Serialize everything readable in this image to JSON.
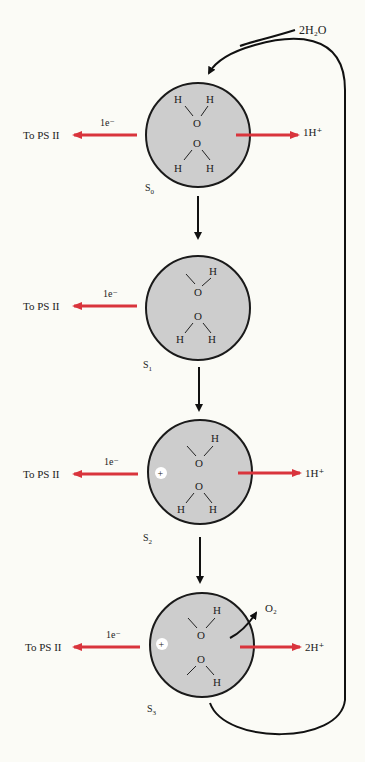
{
  "diagram": {
    "input_label": "2H₂O",
    "colors": {
      "circle_fill": "#cdcdcd",
      "circle_stroke": "#1a1a1a",
      "red_arrow": "#d9343c",
      "black_arrow": "#111111",
      "background": "#fbfbf6"
    },
    "states": [
      {
        "name": "S",
        "sub": "0",
        "electron_label": "1e⁻",
        "electron_dest": "To PS II",
        "proton_label": "1H⁺",
        "has_plus": false,
        "o2": false
      },
      {
        "name": "S",
        "sub": "1",
        "electron_label": "1e⁻",
        "electron_dest": "To PS II",
        "proton_label": "",
        "has_plus": false,
        "o2": false
      },
      {
        "name": "S",
        "sub": "2",
        "electron_label": "1e⁻",
        "electron_dest": "To PS II",
        "proton_label": "1H⁺",
        "has_plus": true,
        "o2": false
      },
      {
        "name": "S",
        "sub": "3",
        "electron_label": "1e⁻",
        "electron_dest": "To PS II",
        "proton_label": "2H⁺",
        "has_plus": true,
        "o2": true
      }
    ],
    "o2_label": "O₂",
    "atom_labels": {
      "h": "H",
      "o": "O",
      "plus": "+"
    }
  }
}
